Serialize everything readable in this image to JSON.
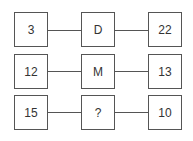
{
  "puzzle": {
    "rows": [
      {
        "left": "3",
        "middle": "D",
        "right": "22"
      },
      {
        "left": "12",
        "middle": "M",
        "right": "13"
      },
      {
        "left": "15",
        "middle": "?",
        "right": "10"
      }
    ]
  }
}
